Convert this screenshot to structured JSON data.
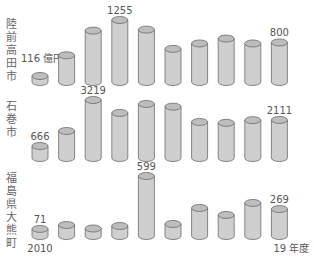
{
  "chart_data": {
    "type": "bar",
    "style": "3d-cylinder",
    "title": "",
    "xlabel": "年度",
    "ylabel": "億円",
    "unit": "億円",
    "categories": [
      "2010",
      "2011",
      "2012",
      "2013",
      "2014",
      "2015",
      "2016",
      "2017",
      "2018",
      "2019"
    ],
    "x_tick_labels": {
      "first": "2010",
      "last": "19 年度"
    },
    "series": [
      {
        "name": "陸前高田市",
        "values": [
          116,
          540,
          1040,
          1255,
          1060,
          670,
          780,
          880,
          780,
          800
        ],
        "labeled": {
          "0": "116 億円",
          "3": "1255",
          "9": "800"
        },
        "max": 1255
      },
      {
        "name": "石巻市",
        "values": [
          666,
          1500,
          3219,
          2500,
          3000,
          2850,
          2000,
          1950,
          2100,
          2111
        ],
        "labeled": {
          "0": "666",
          "2": "3219",
          "9": "2111"
        },
        "max": 3219
      },
      {
        "name": "福島県大熊町",
        "values": [
          71,
          110,
          75,
          100,
          599,
          120,
          280,
          210,
          330,
          269
        ],
        "labeled": {
          "0": "71",
          "4": "599",
          "9": "269"
        },
        "max": 599
      }
    ],
    "grid": false,
    "legend": "none",
    "colors": {
      "fill": "#cfcfcf",
      "top": "#bdbdbd",
      "stroke": "#6a6a6a",
      "text": "#555555"
    }
  },
  "labels": {
    "row1": "陸前高田市",
    "row2": "石巻市",
    "row3": "福島県大熊町",
    "x_first": "2010",
    "x_last": "19 年度"
  }
}
